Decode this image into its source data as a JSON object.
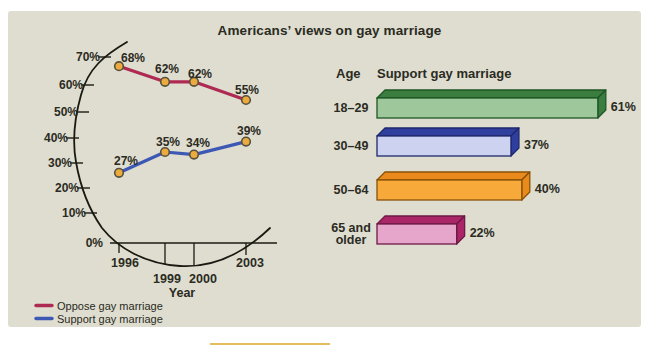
{
  "title": "Americans’ views on gay marriage",
  "colors": {
    "page_bg": "#ffffff",
    "panel_bg": "#deddd0",
    "text": "#2b2b22",
    "axis": "#1a1a12",
    "accent_bar": "#e4bd5e"
  },
  "chart_data": [
    {
      "type": "line",
      "title": "Americans’ views on gay marriage",
      "xlabel": "Year",
      "ylabel": "",
      "x": [
        "1996",
        "1999",
        "2000",
        "2003"
      ],
      "yticks": [
        "70%",
        "60%",
        "50%",
        "40%",
        "30%",
        "20%",
        "10%",
        "0%"
      ],
      "ylim": [
        0,
        70
      ],
      "grid": false,
      "axis_style": "hand-sketched curved y-axis arc",
      "legend_position": "bottom-left",
      "marker": {
        "fill": "#ecab3f",
        "stroke": "#55513d"
      },
      "series": [
        {
          "name": "Oppose gay marriage",
          "color": "#ae2a52",
          "values": [
            68,
            62,
            62,
            55
          ],
          "point_labels": [
            "68%",
            "62%",
            "62%",
            "55%"
          ]
        },
        {
          "name": "Support gay marriage",
          "color": "#3d58b4",
          "values": [
            27,
            35,
            34,
            39
          ],
          "point_labels": [
            "27%",
            "35%",
            "34%",
            "39%"
          ]
        }
      ]
    },
    {
      "type": "bar",
      "orientation": "horizontal",
      "ylabel": "Age",
      "title": "Support gay marriage",
      "categories": [
        "18–29",
        "30–49",
        "50–64",
        "65 and older"
      ],
      "values": [
        61,
        37,
        40,
        22
      ],
      "value_labels": [
        "61%",
        "37%",
        "40%",
        "22%"
      ],
      "xlim": [
        0,
        65
      ],
      "bar_style": "3d-beveled",
      "bar_colors": [
        {
          "front": "#9ec79b",
          "side": "#3b7d3f",
          "border": "#1f5626"
        },
        {
          "front": "#cdd2f0",
          "side": "#2e3f9e",
          "border": "#20296e"
        },
        {
          "front": "#f7a93a",
          "side": "#ea8a1c",
          "border": "#8a5208"
        },
        {
          "front": "#e6a5ca",
          "side": "#aa2668",
          "border": "#6e1a44"
        }
      ]
    }
  ]
}
